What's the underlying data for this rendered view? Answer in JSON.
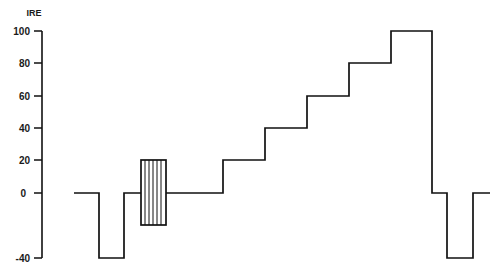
{
  "diagram": {
    "title": "",
    "type": "video waveform (IRE staircase test signal)",
    "y_axis": {
      "unit_label": "IRE",
      "ticks": [
        {
          "value": 100,
          "label": "100"
        },
        {
          "value": 80,
          "label": "80"
        },
        {
          "value": 60,
          "label": "60"
        },
        {
          "value": 40,
          "label": "40"
        },
        {
          "value": 20,
          "label": "20"
        },
        {
          "value": 0,
          "label": "0"
        },
        {
          "value": -40,
          "label": "-40"
        }
      ],
      "range": [
        -40,
        100
      ]
    },
    "waveform": {
      "segments": [
        {
          "name": "front-porch",
          "level": 0
        },
        {
          "name": "sync-pulse",
          "level": -40
        },
        {
          "name": "back-porch",
          "level": 0
        },
        {
          "name": "color-burst",
          "level_min": -20,
          "level_max": 20
        },
        {
          "name": "blanking",
          "level": 0
        },
        {
          "name": "step-1",
          "level": 20
        },
        {
          "name": "step-2",
          "level": 40
        },
        {
          "name": "step-3",
          "level": 60
        },
        {
          "name": "step-4",
          "level": 80
        },
        {
          "name": "step-5",
          "level": 100
        },
        {
          "name": "front-porch-2",
          "level": 0
        },
        {
          "name": "sync-pulse-2",
          "level": -40
        },
        {
          "name": "back-porch-2",
          "level": 0
        }
      ]
    },
    "colors": {
      "line": "#111111",
      "background": "#ffffff"
    }
  }
}
